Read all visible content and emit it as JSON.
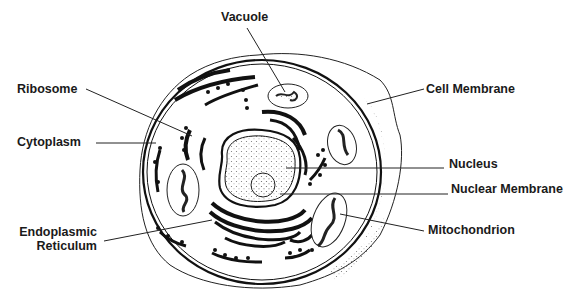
{
  "diagram": {
    "colors": {
      "ink": "#111111",
      "background": "#ffffff",
      "stipple": "#888888"
    },
    "labels": [
      {
        "id": "vacuole",
        "text": "Vacuole",
        "x": 221,
        "y": 10
      },
      {
        "id": "ribosome",
        "text": "Ribosome",
        "x": 17,
        "y": 82
      },
      {
        "id": "cytoplasm",
        "text": "Cytoplasm",
        "x": 17,
        "y": 135
      },
      {
        "id": "cell-membrane",
        "text": "Cell Membrane",
        "x": 426,
        "y": 82
      },
      {
        "id": "nucleus",
        "text": "Nucleus",
        "x": 449,
        "y": 157
      },
      {
        "id": "nuclear-membrane",
        "text": "Nuclear Membrane",
        "x": 451,
        "y": 182
      },
      {
        "id": "endoplasmic-reticulum",
        "line1": "Endoplasmic",
        "line2": "Reticulum",
        "x": 12,
        "y": 225
      },
      {
        "id": "mitochondrion",
        "text": "Mitochondrion",
        "x": 428,
        "y": 223
      }
    ]
  }
}
